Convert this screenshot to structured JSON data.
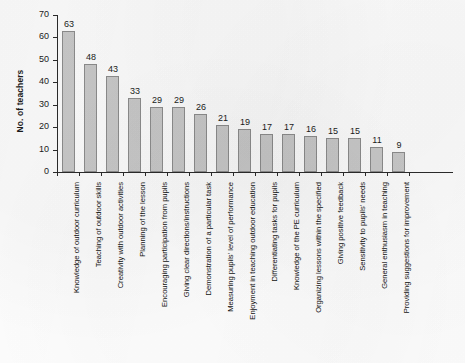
{
  "chart_data": {
    "type": "bar",
    "title": "",
    "subtitle": "",
    "xlabel": "",
    "ylabel": "No. of teachers",
    "ylim": [
      0,
      70
    ],
    "ytick_step": 10,
    "yticks": [
      "70",
      "60",
      "50",
      "40",
      "30",
      "20",
      "10",
      "0"
    ],
    "grid": false,
    "legend": null,
    "orientation": "vertical",
    "bar_color": "#c9c9c9",
    "bar_border_color": "#8d8d8d",
    "axis_color": "#2b2b2b",
    "value_labels_shown": true,
    "categories": [
      "Knowledge of outdoor curriculum",
      "Teaching of outdoor skills",
      "Creativity with outdoor activities",
      "Planning of the lesson",
      "Encouraging participation from pupils",
      "Giving clear directions/instructions",
      "Demonstration of a particular task",
      "Measuring pupils' level of performance",
      "Enjoyment in teaching outdoor education",
      "Differentiating tasks for pupils",
      "Knowledge of the PE curriculum",
      "Organizing lessons within the specified",
      "Giving positive feedback",
      "Sensitivity to pupils' needs",
      "General enthusiasm in teaching",
      "Providing suggestions for improvement"
    ],
    "values": [
      63,
      48,
      43,
      33,
      29,
      29,
      26,
      21,
      19,
      17,
      17,
      16,
      15,
      15,
      11,
      9
    ]
  }
}
